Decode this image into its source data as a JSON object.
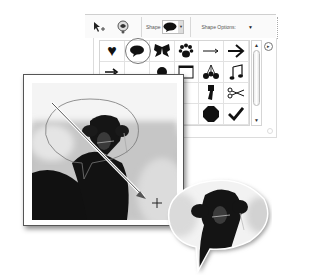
{
  "options_bar": {
    "tool_icon": "custom-shape-tool-icon",
    "color_icon": "shape-color-icon",
    "shape_label": "Shape",
    "selected_shape": "speech-bubble",
    "shape_options_label": "Shape Options:",
    "dropdown_arrow": "▼"
  },
  "shape_panel": {
    "shapes": [
      {
        "name": "heart",
        "glyph": "♥"
      },
      {
        "name": "speech-bubble",
        "glyph": "💬",
        "selected": true
      },
      {
        "name": "butterfly",
        "glyph": "🦋"
      },
      {
        "name": "paw-print",
        "glyph": "🐾"
      },
      {
        "name": "thin-arrow",
        "glyph": "→"
      },
      {
        "name": "bold-arrow",
        "glyph": "➔"
      },
      {
        "name": "pointing-arrow",
        "glyph": "➤"
      },
      {
        "name": "blank",
        "glyph": ""
      },
      {
        "name": "blob",
        "glyph": "●"
      },
      {
        "name": "frame",
        "glyph": "▭"
      },
      {
        "name": "cherries",
        "glyph": "🍒"
      },
      {
        "name": "music-note",
        "glyph": "♫"
      },
      {
        "name": "shape-15",
        "glyph": ""
      },
      {
        "name": "shape-16",
        "glyph": ""
      },
      {
        "name": "shape-17",
        "glyph": ""
      },
      {
        "name": "shape-18",
        "glyph": ""
      },
      {
        "name": "pushpin",
        "glyph": "📌"
      },
      {
        "name": "scissors",
        "glyph": "✂"
      },
      {
        "name": "shape-19",
        "glyph": ""
      },
      {
        "name": "shape-20",
        "glyph": ""
      },
      {
        "name": "shape-21",
        "glyph": ""
      },
      {
        "name": "shape-22",
        "glyph": ""
      },
      {
        "name": "octagon",
        "glyph": "⬣"
      },
      {
        "name": "checkmark",
        "glyph": "✔"
      }
    ],
    "scroll_up": "▲",
    "scroll_down": "▼",
    "flyout": "▸"
  },
  "canvas": {
    "subject": "camel photo with speech bubble shape drawn",
    "crosshair": "+"
  },
  "result": {
    "subject": "camel photo clipped to speech bubble"
  }
}
